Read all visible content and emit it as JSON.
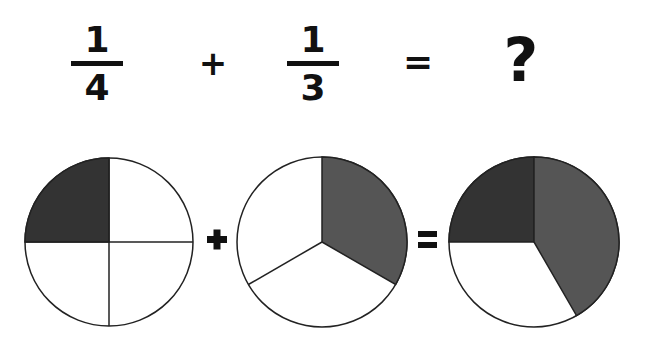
{
  "equation": {
    "term1": {
      "numerator": "1",
      "denominator": "4"
    },
    "operator_plus": "+",
    "term2": {
      "numerator": "1",
      "denominator": "3"
    },
    "operator_equals": "=",
    "result": "?"
  },
  "diagram": {
    "operator_plus": "+",
    "operator_equals": "=",
    "colors": {
      "quarter_fill": "#333333",
      "third_fill": "#555555",
      "empty_fill": "#ffffff",
      "stroke": "#222222"
    },
    "circles": [
      {
        "label": "one-quarter",
        "parts": 4,
        "shaded": 1
      },
      {
        "label": "one-third",
        "parts": 3,
        "shaded": 1
      },
      {
        "label": "sum",
        "shaded_quarter": 1,
        "shaded_third": 1
      }
    ]
  }
}
